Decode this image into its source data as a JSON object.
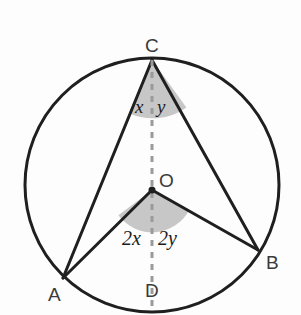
{
  "figure": {
    "type": "circle-geometry-diagram",
    "width": 301,
    "height": 315,
    "background_color": "#fdfdfd",
    "stroke_color": "#1f1f1f",
    "dash_color": "#9a9a9a",
    "sector_fill": "#c7c7c7",
    "circle": {
      "cx": 152,
      "cy": 185,
      "r": 127
    },
    "points": {
      "C": {
        "x": 152,
        "y": 60
      },
      "A": {
        "x": 63,
        "y": 278
      },
      "B": {
        "x": 258,
        "y": 250
      },
      "O": {
        "x": 152,
        "y": 190
      },
      "D": {
        "x": 152,
        "y": 312
      }
    },
    "sectors": {
      "at_C": {
        "radius": 58
      },
      "at_O": {
        "radius": 42
      }
    }
  },
  "labels": {
    "point_c": "C",
    "point_a": "A",
    "point_b": "B",
    "point_o": "O",
    "point_d": "D",
    "angle_x": "x",
    "angle_y": "y",
    "angle_2x": "2x",
    "angle_2y": "2y"
  }
}
